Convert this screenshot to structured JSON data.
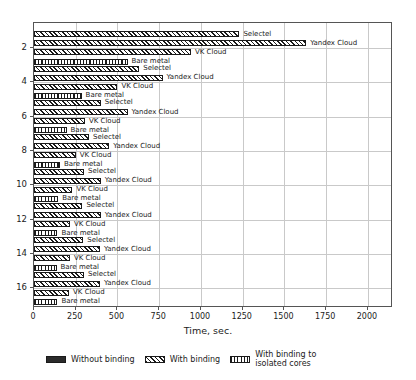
{
  "chart_data": {
    "type": "bar",
    "orientation": "horizontal",
    "title": "",
    "xlabel": "Time, sec.",
    "ylabel": "",
    "xlim": [
      0,
      2150
    ],
    "xticks": [
      0,
      250,
      500,
      750,
      1000,
      1250,
      1500,
      1750,
      2000
    ],
    "yticks": [
      2,
      4,
      6,
      8,
      10,
      12,
      14,
      16
    ],
    "grid": "vertical-and-horizontal",
    "legend_position": "below-axes",
    "legend": [
      {
        "label": "Without binding",
        "pattern": "solid"
      },
      {
        "label": "With binding",
        "pattern": "diagonal-hatch"
      },
      {
        "label": "With binding to\nisolated cores",
        "pattern": "vertical-hatch"
      }
    ],
    "series_names": [
      "Selectel",
      "Yandex Cloud",
      "VK Cloud",
      "Bare metal"
    ],
    "groups": [
      {
        "y": 2,
        "bars": [
          {
            "name": "Selectel",
            "value": 1230,
            "pattern": "diagonal-hatch"
          },
          {
            "name": "Yandex Cloud",
            "value": 1630,
            "pattern": "diagonal-hatch"
          },
          {
            "name": "VK Cloud",
            "value": 940,
            "pattern": "diagonal-hatch"
          },
          {
            "name": "Bare metal",
            "value": 560,
            "pattern": "vertical-hatch"
          }
        ]
      },
      {
        "y": 4,
        "bars": [
          {
            "name": "Selectel",
            "value": 630,
            "pattern": "diagonal-hatch"
          },
          {
            "name": "Yandex Cloud",
            "value": 770,
            "pattern": "diagonal-hatch"
          },
          {
            "name": "VK Cloud",
            "value": 500,
            "pattern": "diagonal-hatch"
          },
          {
            "name": "Bare metal",
            "value": 285,
            "pattern": "vertical-hatch"
          }
        ]
      },
      {
        "y": 6,
        "bars": [
          {
            "name": "Selectel",
            "value": 400,
            "pattern": "diagonal-hatch"
          },
          {
            "name": "Yandex Cloud",
            "value": 560,
            "pattern": "diagonal-hatch"
          },
          {
            "name": "VK Cloud",
            "value": 305,
            "pattern": "diagonal-hatch"
          },
          {
            "name": "Bare metal",
            "value": 195,
            "pattern": "vertical-hatch"
          }
        ]
      },
      {
        "y": 8,
        "bars": [
          {
            "name": "Selectel",
            "value": 330,
            "pattern": "diagonal-hatch"
          },
          {
            "name": "Yandex Cloud",
            "value": 450,
            "pattern": "diagonal-hatch"
          },
          {
            "name": "VK Cloud",
            "value": 250,
            "pattern": "diagonal-hatch"
          },
          {
            "name": "Bare metal",
            "value": 155,
            "pattern": "vertical-hatch"
          }
        ]
      },
      {
        "y": 10,
        "bars": [
          {
            "name": "Selectel",
            "value": 300,
            "pattern": "diagonal-hatch"
          },
          {
            "name": "Yandex Cloud",
            "value": 400,
            "pattern": "diagonal-hatch"
          },
          {
            "name": "VK Cloud",
            "value": 230,
            "pattern": "diagonal-hatch"
          },
          {
            "name": "Bare metal",
            "value": 145,
            "pattern": "vertical-hatch"
          }
        ]
      },
      {
        "y": 12,
        "bars": [
          {
            "name": "Selectel",
            "value": 290,
            "pattern": "diagonal-hatch"
          },
          {
            "name": "Yandex Cloud",
            "value": 400,
            "pattern": "diagonal-hatch"
          },
          {
            "name": "VK Cloud",
            "value": 215,
            "pattern": "diagonal-hatch"
          },
          {
            "name": "Bare metal",
            "value": 140,
            "pattern": "vertical-hatch"
          }
        ]
      },
      {
        "y": 14,
        "bars": [
          {
            "name": "Selectel",
            "value": 295,
            "pattern": "diagonal-hatch"
          },
          {
            "name": "Yandex Cloud",
            "value": 395,
            "pattern": "diagonal-hatch"
          },
          {
            "name": "VK Cloud",
            "value": 215,
            "pattern": "diagonal-hatch"
          },
          {
            "name": "Bare metal",
            "value": 135,
            "pattern": "vertical-hatch"
          }
        ]
      },
      {
        "y": 16,
        "bars": [
          {
            "name": "Selectel",
            "value": 300,
            "pattern": "diagonal-hatch"
          },
          {
            "name": "Yandex Cloud",
            "value": 395,
            "pattern": "diagonal-hatch"
          },
          {
            "name": "VK Cloud",
            "value": 210,
            "pattern": "diagonal-hatch"
          },
          {
            "name": "Bare metal",
            "value": 140,
            "pattern": "vertical-hatch"
          }
        ]
      }
    ]
  },
  "colors": {
    "bar_fill": "#2b2b2b",
    "bar_edge": "#1a1a1a",
    "grid": "#c9c9c9",
    "axis": "#555555",
    "text": "#1b1b1b",
    "background": "#ffffff"
  }
}
